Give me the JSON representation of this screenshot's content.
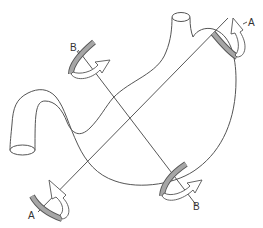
{
  "diagram": {
    "axes": [
      {
        "id": "A",
        "label_start": "A",
        "label_end": "A",
        "from": [
          40,
          210
        ],
        "to": [
          228,
          18
        ]
      },
      {
        "id": "B",
        "label_start": "B",
        "label_end": "B",
        "from": [
          80,
          58
        ],
        "to": [
          195,
          205
        ]
      }
    ],
    "labels": {
      "a_top": "A",
      "a_bottom": "A",
      "b_top": "B",
      "b_bottom": "B"
    },
    "colors": {
      "line": "#555555",
      "rod_fill": "#a6a6a6",
      "background": "#ffffff"
    }
  }
}
